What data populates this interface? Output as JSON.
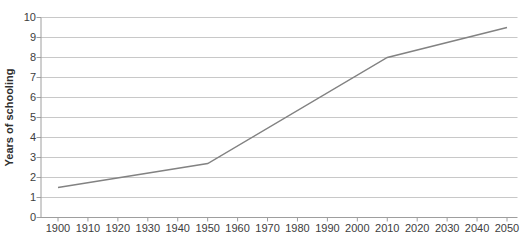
{
  "chart_data": {
    "type": "line",
    "title": "",
    "xlabel": "",
    "ylabel": "Years of schooling",
    "xlim": [
      1900,
      2050
    ],
    "ylim": [
      0,
      10
    ],
    "xticks": [
      1900,
      1910,
      1920,
      1930,
      1940,
      1950,
      1960,
      1970,
      1980,
      1990,
      2000,
      2010,
      2020,
      2030,
      2040,
      2050
    ],
    "yticks": [
      0,
      1,
      2,
      3,
      4,
      5,
      6,
      7,
      8,
      9,
      10
    ],
    "grid": "horizontal",
    "legend": "none",
    "series": [
      {
        "name": "Years of schooling",
        "points": [
          [
            1900,
            1.5
          ],
          [
            1950,
            2.7
          ],
          [
            2010,
            8.0
          ],
          [
            2050,
            9.5
          ]
        ],
        "color": "#828282"
      }
    ],
    "colors": {
      "background": "#ffffff",
      "gridline": "#c8c8c8",
      "axis": "#9e9e9e",
      "tick": "#9e9e9e",
      "tick_label": "#3d3d3d",
      "axis_title": "#2e2e2e"
    }
  }
}
